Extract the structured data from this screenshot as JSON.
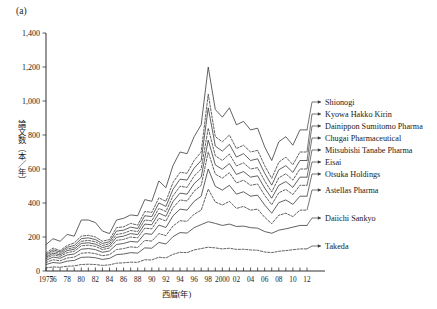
{
  "panel_label": "(a)",
  "chart_data": {
    "type": "line",
    "title": "",
    "xlabel": "西暦(年)",
    "ylabel": "論文数（本／年）",
    "xlim": [
      1975,
      2012
    ],
    "ylim": [
      0,
      1400
    ],
    "ytick_values": [
      0,
      200,
      400,
      600,
      800,
      1000,
      1200,
      1400
    ],
    "ytick_labels": [
      "0",
      "200",
      "400",
      "600",
      "800",
      "1,000",
      "1,200",
      "1,400"
    ],
    "xtick_values": [
      1975,
      1976,
      1978,
      1980,
      1982,
      1984,
      1986,
      1988,
      1990,
      1992,
      1994,
      1996,
      1998,
      2000,
      2002,
      2004,
      2006,
      2008,
      2010,
      2012
    ],
    "xtick_labels": [
      "1975",
      "76",
      "78",
      "80",
      "82",
      "84",
      "86",
      "88",
      "90",
      "92",
      "94",
      "96",
      "98",
      "2000",
      "02",
      "04",
      "06",
      "08",
      "10",
      "12"
    ],
    "grid": false,
    "legend_position": "right",
    "x": [
      1975,
      1976,
      1977,
      1978,
      1979,
      1980,
      1981,
      1982,
      1983,
      1984,
      1985,
      1986,
      1987,
      1988,
      1989,
      1990,
      1991,
      1992,
      1993,
      1994,
      1995,
      1996,
      1997,
      1998,
      1999,
      2000,
      2001,
      2002,
      2003,
      2004,
      2005,
      2006,
      2007,
      2008,
      2009,
      2010,
      2011,
      2012
    ],
    "series": [
      {
        "name": "Shionogi",
        "style": "solid",
        "values": [
          155,
          190,
          175,
          215,
          205,
          300,
          300,
          285,
          235,
          220,
          300,
          310,
          330,
          325,
          420,
          410,
          530,
          490,
          620,
          700,
          690,
          790,
          860,
          1200,
          950,
          905,
          960,
          860,
          880,
          830,
          840,
          730,
          650,
          760,
          790,
          740,
          830,
          830
        ]
      },
      {
        "name": "Kyowa Hakko Kirin",
        "style": "dashed",
        "values": [
          105,
          135,
          120,
          150,
          165,
          205,
          210,
          200,
          175,
          185,
          255,
          260,
          280,
          270,
          350,
          345,
          430,
          410,
          520,
          580,
          575,
          650,
          700,
          1040,
          790,
          760,
          800,
          720,
          740,
          700,
          710,
          620,
          545,
          640,
          670,
          625,
          700,
          700
        ]
      },
      {
        "name": "Dainippon Sumitomo Pharma",
        "style": "solid",
        "values": [
          95,
          125,
          112,
          140,
          150,
          190,
          195,
          185,
          162,
          172,
          235,
          240,
          258,
          250,
          325,
          320,
          400,
          380,
          480,
          540,
          535,
          605,
          650,
          960,
          735,
          705,
          745,
          670,
          690,
          650,
          660,
          575,
          505,
          595,
          620,
          580,
          650,
          650
        ]
      },
      {
        "name": "Chugai Pharmaceutical",
        "style": "dashed",
        "values": [
          88,
          115,
          104,
          130,
          138,
          175,
          180,
          172,
          150,
          160,
          215,
          222,
          238,
          232,
          300,
          295,
          368,
          350,
          442,
          498,
          492,
          558,
          600,
          840,
          678,
          650,
          688,
          618,
          636,
          600,
          608,
          530,
          465,
          548,
          572,
          535,
          600,
          600
        ]
      },
      {
        "name": "Mitsubishi Tanabe Pharma",
        "style": "solid",
        "values": [
          80,
          105,
          95,
          120,
          128,
          162,
          166,
          158,
          138,
          148,
          198,
          205,
          220,
          214,
          276,
          272,
          340,
          322,
          408,
          458,
          452,
          514,
          552,
          770,
          624,
          598,
          632,
          568,
          585,
          552,
          560,
          488,
          428,
          504,
          526,
          492,
          552,
          552
        ]
      },
      {
        "name": "Eisai",
        "style": "dashed",
        "values": [
          72,
          95,
          86,
          108,
          116,
          148,
          152,
          145,
          126,
          135,
          180,
          186,
          200,
          195,
          252,
          248,
          310,
          294,
          372,
          418,
          412,
          470,
          504,
          700,
          570,
          546,
          578,
          518,
          534,
          504,
          512,
          445,
          390,
          460,
          480,
          450,
          504,
          504
        ]
      },
      {
        "name": "Otsuka Holdings",
        "style": "solid",
        "values": [
          62,
          82,
          75,
          94,
          100,
          128,
          132,
          126,
          110,
          118,
          156,
          162,
          174,
          170,
          220,
          216,
          270,
          256,
          324,
          364,
          358,
          410,
          440,
          600,
          498,
          476,
          504,
          452,
          466,
          440,
          446,
          388,
          340,
          402,
          418,
          392,
          440,
          440
        ]
      },
      {
        "name": "Astellas Pharma",
        "style": "dashed",
        "values": [
          50,
          66,
          60,
          76,
          82,
          104,
          108,
          102,
          90,
          96,
          126,
          132,
          142,
          138,
          180,
          176,
          220,
          208,
          264,
          296,
          292,
          334,
          358,
          482,
          406,
          388,
          410,
          368,
          380,
          358,
          364,
          316,
          278,
          328,
          340,
          320,
          358,
          358
        ]
      },
      {
        "name": "Daiichi Sankyo",
        "style": "solid",
        "values": [
          38,
          50,
          46,
          58,
          62,
          80,
          82,
          78,
          68,
          74,
          96,
          100,
          108,
          105,
          136,
          134,
          168,
          159,
          202,
          226,
          223,
          255,
          273,
          290,
          280,
          268,
          276,
          262,
          264,
          255,
          252,
          232,
          222,
          240,
          248,
          258,
          268,
          268
        ]
      },
      {
        "name": "Takeda",
        "style": "dashed",
        "values": [
          18,
          24,
          22,
          28,
          30,
          38,
          40,
          38,
          33,
          36,
          46,
          48,
          52,
          51,
          66,
          65,
          81,
          77,
          98,
          110,
          108,
          124,
          132,
          140,
          136,
          130,
          134,
          127,
          128,
          124,
          122,
          112,
          108,
          116,
          120,
          125,
          130,
          130
        ]
      }
    ],
    "legend_entries": [
      {
        "label": "Shionogi",
        "style": "solid"
      },
      {
        "label": "Kyowa Hakko Kirin",
        "style": "dashed"
      },
      {
        "label": "Dainippon Sumitomo Pharma",
        "style": "solid"
      },
      {
        "label": "Chugai Pharmaceutical",
        "style": "dashed"
      },
      {
        "label": "Mitsubishi Tanabe Pharma",
        "style": "solid"
      },
      {
        "label": "Eisai",
        "style": "dashed"
      },
      {
        "label": "Otsuka Holdings",
        "style": "solid"
      },
      {
        "label": "Astellas Pharma",
        "style": "dashed"
      },
      {
        "label": "Daiichi Sankyo",
        "style": "solid"
      },
      {
        "label": "Takeda",
        "style": "dashed"
      }
    ]
  }
}
